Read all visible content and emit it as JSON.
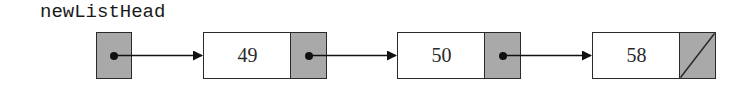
{
  "diagram": {
    "type": "singly-linked-list",
    "head_label": "newListHead",
    "nodes": [
      {
        "value": "49",
        "next": "node-2"
      },
      {
        "value": "50",
        "next": "node-3"
      },
      {
        "value": "58",
        "next": "null"
      }
    ],
    "colors": {
      "pointer_fill": "#a9a9a9",
      "data_fill": "#ffffff",
      "stroke": "#2a2a2a"
    }
  }
}
